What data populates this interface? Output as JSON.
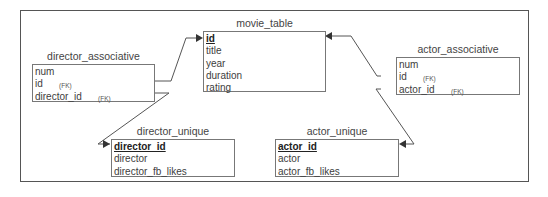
{
  "diagram": {
    "type": "entity-relationship",
    "entities": [
      {
        "name": "movie_table",
        "fields": [
          {
            "label": "id",
            "pk": true
          },
          {
            "label": "title"
          },
          {
            "label": "year"
          },
          {
            "label": "duration"
          },
          {
            "label": "rating"
          }
        ]
      },
      {
        "name": "director_associative",
        "fields": [
          {
            "label": "num"
          },
          {
            "label": "id",
            "fk": "(FK)"
          },
          {
            "label": "director_id",
            "fk": "(FK)"
          }
        ]
      },
      {
        "name": "actor_associative",
        "fields": [
          {
            "label": "num"
          },
          {
            "label": "id",
            "fk": "(FK)"
          },
          {
            "label": "actor_id",
            "fk": "(FK)"
          }
        ]
      },
      {
        "name": "director_unique",
        "fields": [
          {
            "label": "director_id",
            "pk": true
          },
          {
            "label": "director"
          },
          {
            "label": "director_fb_likes"
          }
        ]
      },
      {
        "name": "actor_unique",
        "fields": [
          {
            "label": "actor_id",
            "pk": true
          },
          {
            "label": "actor"
          },
          {
            "label": "actor_fb_likes"
          }
        ]
      }
    ],
    "relationships": [
      {
        "from": "director_associative.id",
        "to": "movie_table.id"
      },
      {
        "from": "director_associative.director_id",
        "to": "director_unique.director_id"
      },
      {
        "from": "actor_associative.id",
        "to": "movie_table.id"
      },
      {
        "from": "actor_associative.actor_id",
        "to": "actor_unique.actor_id"
      }
    ]
  }
}
